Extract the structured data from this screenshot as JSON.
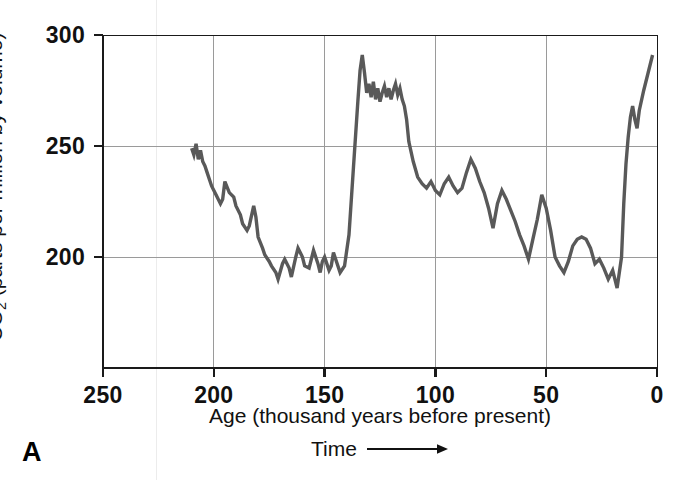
{
  "figure": {
    "panel_label": "A",
    "time_annotation": "Time",
    "time_arrow_icon": "right-arrow-icon"
  },
  "chart_data": {
    "type": "line",
    "title": "",
    "xlabel": "Age (thousand years before present)",
    "ylabel": "CO₂ (parts per million by volume)",
    "ylabel_text": "CO2 (parts per million by volume)",
    "xlim": [
      250,
      0
    ],
    "ylim": [
      150,
      300
    ],
    "x_reversed": true,
    "xticks": [
      250,
      200,
      150,
      100,
      50,
      0
    ],
    "xticklabels": [
      "250",
      "200",
      "150",
      "100",
      "50",
      "0"
    ],
    "yticks": [
      200,
      250,
      300
    ],
    "yticklabels": [
      "200",
      "250",
      "300"
    ],
    "grid": true,
    "gridlines_x": [
      200,
      150,
      100,
      50
    ],
    "gridlines_y": [
      200,
      250,
      300
    ],
    "legend": null,
    "series": [
      {
        "name": "Vostok ice core CO2",
        "color": "#595959",
        "linewidth": 3.4,
        "x": [
          210,
          209,
          208,
          207,
          206,
          205,
          204,
          203,
          201,
          199,
          197,
          196,
          195,
          193,
          191,
          190,
          188,
          187,
          185,
          184,
          182,
          181,
          180,
          178,
          177,
          175,
          174,
          172,
          171,
          169,
          168,
          166,
          165,
          163,
          162,
          160,
          159,
          157,
          156,
          155,
          154,
          153,
          152,
          151,
          150,
          149,
          148,
          147,
          146,
          145,
          143,
          141,
          139,
          137,
          135,
          134,
          133,
          132,
          131,
          130,
          129,
          128,
          127,
          126,
          125,
          124,
          123,
          122,
          121,
          120,
          119,
          118,
          117,
          116,
          115,
          114,
          113,
          112,
          110,
          108,
          106,
          104,
          102,
          100,
          98,
          96,
          94,
          92,
          90,
          88,
          86,
          84,
          82,
          80,
          78,
          76,
          74,
          72,
          70,
          68,
          66,
          64,
          62,
          60,
          58,
          56,
          54,
          52,
          50,
          48,
          46,
          44,
          42,
          40,
          38,
          36,
          34,
          32,
          30,
          28,
          26,
          24,
          22,
          20,
          18,
          16,
          15,
          14,
          13,
          12,
          11,
          10,
          9,
          8,
          6,
          4,
          2
        ],
        "y": [
          249,
          246,
          251,
          244,
          248,
          243,
          241,
          238,
          232,
          228,
          224,
          226,
          234,
          229,
          227,
          223,
          219,
          215,
          212,
          214,
          223,
          218,
          209,
          204,
          201,
          198,
          196,
          193,
          190,
          197,
          199,
          195,
          191,
          200,
          204,
          200,
          196,
          195,
          199,
          203,
          200,
          197,
          193,
          198,
          200,
          197,
          194,
          196,
          202,
          199,
          193,
          196,
          210,
          240,
          270,
          284,
          291,
          283,
          274,
          278,
          272,
          279,
          271,
          276,
          270,
          274,
          277,
          272,
          276,
          271,
          275,
          278,
          273,
          276,
          271,
          268,
          262,
          252,
          243,
          236,
          233,
          231,
          234,
          230,
          228,
          233,
          236,
          232,
          229,
          231,
          238,
          244,
          240,
          234,
          229,
          222,
          213,
          224,
          230,
          226,
          221,
          216,
          210,
          205,
          199,
          208,
          217,
          228,
          222,
          212,
          200,
          196,
          193,
          198,
          205,
          208,
          209,
          208,
          204,
          197,
          199,
          195,
          190,
          194,
          186,
          200,
          224,
          242,
          254,
          263,
          268,
          262,
          258,
          266,
          275,
          283,
          291
        ]
      }
    ]
  },
  "axes": {
    "y_ticks": [
      {
        "value": 300,
        "label": "300"
      },
      {
        "value": 250,
        "label": "250"
      },
      {
        "value": 200,
        "label": "200"
      }
    ],
    "x_ticks": [
      {
        "value": 250,
        "label": "250"
      },
      {
        "value": 200,
        "label": "200"
      },
      {
        "value": 150,
        "label": "150"
      },
      {
        "value": 100,
        "label": "100"
      },
      {
        "value": 50,
        "label": "50"
      },
      {
        "value": 0,
        "label": "0"
      }
    ]
  },
  "colors": {
    "series": "#595959",
    "axis": "#1a1a1a",
    "grid": "#9a9a9a",
    "background": "#ffffff",
    "text": "#111111"
  }
}
